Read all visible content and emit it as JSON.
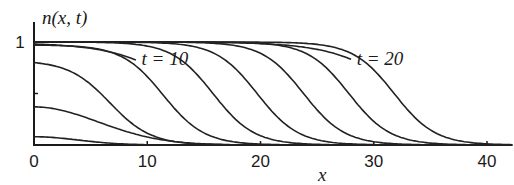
{
  "chart_data": {
    "type": "line",
    "title": "",
    "xlabel": "x",
    "ylabel": "n(x, t)",
    "xlim": [
      0,
      42
    ],
    "ylim": [
      0,
      1
    ],
    "xticks": [
      0,
      10,
      20,
      30,
      40
    ],
    "xtick_labels": [
      "0",
      "10",
      "20",
      "30",
      "40"
    ],
    "yticks": [
      0.5,
      1
    ],
    "ytick_labels": [
      "",
      "1"
    ],
    "grid": false,
    "annotations": [
      {
        "text": "t = 10",
        "x": 9.5,
        "y": 0.78
      },
      {
        "text": "t = 20",
        "x": 28.5,
        "y": 0.78
      }
    ],
    "series": [
      {
        "name": "t0",
        "kind": "bump",
        "amp": 0.08,
        "width": 5.5
      },
      {
        "name": "t1",
        "kind": "bump",
        "amp": 0.37,
        "width": 8.0
      },
      {
        "name": "t2",
        "kind": "front",
        "amp": 0.8,
        "mid": 6.7
      },
      {
        "name": "t3",
        "kind": "front",
        "amp": 0.97,
        "mid": 11.4
      },
      {
        "name": "t4",
        "kind": "front",
        "amp": 1.0,
        "mid": 15.8
      },
      {
        "name": "t5",
        "kind": "front",
        "amp": 1.0,
        "mid": 19.7
      },
      {
        "name": "t6",
        "kind": "front",
        "amp": 1.0,
        "mid": 23.8
      },
      {
        "name": "t7",
        "kind": "front",
        "amp": 1.0,
        "mid": 27.8
      },
      {
        "name": "t8",
        "kind": "front",
        "amp": 1.0,
        "mid": 31.8
      },
      {
        "name": "t10-label-curve",
        "kind": "labelled",
        "amp": 0.98,
        "mid": 14.0,
        "end_x": 9.0
      },
      {
        "name": "t20-label-curve",
        "kind": "labelled",
        "amp": 1.0,
        "mid": 33.0,
        "end_x": 28.0
      }
    ]
  }
}
